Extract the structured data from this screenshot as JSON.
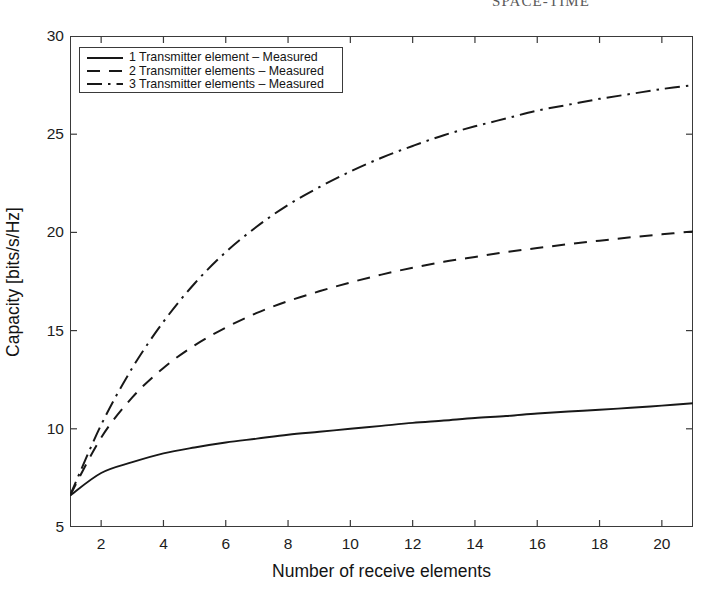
{
  "running_head": "SPACE-TIME",
  "chart_data": {
    "type": "line",
    "title": "",
    "xlabel": "Number of receive elements",
    "ylabel": "Capacity [bits/s/Hz]",
    "xlim": [
      1,
      21
    ],
    "ylim": [
      5,
      30
    ],
    "xticks": [
      2,
      4,
      6,
      8,
      10,
      12,
      14,
      16,
      18,
      20
    ],
    "yticks": [
      5,
      10,
      15,
      20,
      25,
      30
    ],
    "grid": false,
    "legend_position": "upper left",
    "x": [
      1,
      2,
      3,
      4,
      5,
      6,
      7,
      8,
      9,
      10,
      11,
      12,
      13,
      14,
      15,
      16,
      17,
      18,
      19,
      20,
      21
    ],
    "series": [
      {
        "name": "1 Transmitter element – Measured",
        "style": "solid",
        "values": [
          6.6,
          7.75,
          8.3,
          8.75,
          9.05,
          9.3,
          9.5,
          9.7,
          9.85,
          10.0,
          10.15,
          10.3,
          10.42,
          10.55,
          10.65,
          10.78,
          10.88,
          10.97,
          11.07,
          11.18,
          11.3
        ]
      },
      {
        "name": "2 Transmitter elements – Measured",
        "style": "dashed",
        "values": [
          6.6,
          9.55,
          11.6,
          13.1,
          14.25,
          15.15,
          15.9,
          16.5,
          17.0,
          17.45,
          17.85,
          18.2,
          18.5,
          18.75,
          19.0,
          19.2,
          19.4,
          19.58,
          19.75,
          19.9,
          20.05
        ]
      },
      {
        "name": "3 Transmitter elements – Measured",
        "style": "dashdot",
        "values": [
          6.6,
          10.2,
          13.1,
          15.45,
          17.4,
          19.0,
          20.3,
          21.4,
          22.3,
          23.1,
          23.8,
          24.4,
          24.95,
          25.4,
          25.8,
          26.2,
          26.5,
          26.8,
          27.05,
          27.3,
          27.5
        ]
      }
    ]
  },
  "legend": {
    "items": [
      {
        "label": "1 Transmitter element – Measured",
        "sample": "solid-line-icon"
      },
      {
        "label": "2 Transmitter elements – Measured",
        "sample": "dashed-line-icon"
      },
      {
        "label": "3 Transmitter elements – Measured",
        "sample": "dashdot-line-icon"
      }
    ]
  }
}
